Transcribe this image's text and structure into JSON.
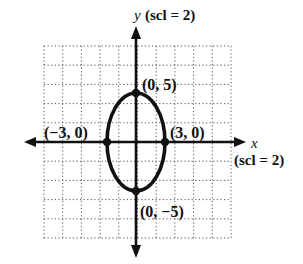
{
  "chart_data": {
    "type": "line",
    "title": "",
    "equation_shape": "ellipse",
    "center": [
      0,
      0
    ],
    "semi_axis_x": 3,
    "semi_axis_y": 5,
    "xlabel": "x",
    "ylabel": "y",
    "x_scale_label": "(scl = 2)",
    "y_scale_label": "(scl = 2)",
    "xlim": [
      -10,
      10
    ],
    "ylim": [
      -10,
      10
    ],
    "grid": true,
    "grid_style": "dotted",
    "points": [
      {
        "x": 0,
        "y": 5,
        "label": "(0, 5)"
      },
      {
        "x": -3,
        "y": 0,
        "label": "(−3, 0)"
      },
      {
        "x": 3,
        "y": 0,
        "label": "(3, 0)"
      },
      {
        "x": 0,
        "y": -5,
        "label": "(0, −5)"
      }
    ]
  },
  "labels": {
    "y_axis": "y",
    "y_scl": "(scl = 2)",
    "x_axis": "x",
    "x_scl": "(scl = 2)",
    "p_top": "(0, 5)",
    "p_left": "(−3, 0)",
    "p_right": "(3, 0)",
    "p_bottom": "(0, −5)"
  },
  "colors": {
    "ink": "#111111",
    "grid": "#555555",
    "background": "#ffffff"
  }
}
